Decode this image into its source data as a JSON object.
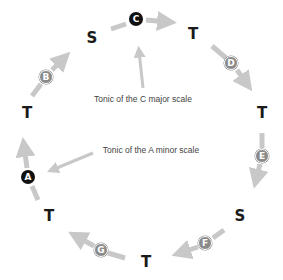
{
  "diagram": {
    "type": "circle-of-scale-steps",
    "colors": {
      "arrow": "#c8c8c8",
      "tonic_note": "#111111",
      "other_note": "#8a8a8a",
      "step_text": "#1a1a1a",
      "label_text": "#444444"
    },
    "notes": [
      {
        "letter": "C",
        "style": "black"
      },
      {
        "letter": "D",
        "style": "gray"
      },
      {
        "letter": "E",
        "style": "gray"
      },
      {
        "letter": "F",
        "style": "gray"
      },
      {
        "letter": "G",
        "style": "gray"
      },
      {
        "letter": "A",
        "style": "black"
      },
      {
        "letter": "B",
        "style": "gray"
      }
    ],
    "steps": [
      {
        "label": "T",
        "between": "C-D"
      },
      {
        "label": "T",
        "between": "D-E"
      },
      {
        "label": "S",
        "between": "E-F"
      },
      {
        "label": "T",
        "between": "F-G"
      },
      {
        "label": "T",
        "between": "G-A"
      },
      {
        "label": "T",
        "between": "A-B"
      },
      {
        "label": "S",
        "between": "B-C"
      }
    ],
    "annotations": [
      {
        "text": "Tonic of the C major scale",
        "points_to": "C"
      },
      {
        "text": "Tonic of the A minor scale",
        "points_to": "A"
      }
    ]
  }
}
